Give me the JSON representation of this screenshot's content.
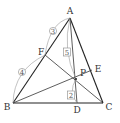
{
  "diagram": {
    "type": "triangle-cevians",
    "points": {
      "A": {
        "label": "A",
        "x": 70,
        "y": 18
      },
      "B": {
        "label": "B",
        "x": 13,
        "y": 103
      },
      "C": {
        "label": "C",
        "x": 103,
        "y": 103
      },
      "D": {
        "label": "D",
        "x": 77,
        "y": 103
      },
      "E": {
        "label": "E",
        "x": 92,
        "y": 70
      },
      "F": {
        "label": "F",
        "x": 45,
        "y": 55
      },
      "P": {
        "label": "P",
        "x": 76,
        "y": 79
      }
    },
    "segments": [
      "AB",
      "BC",
      "CA",
      "AD",
      "BE",
      "CF"
    ],
    "ratios": {
      "AF": {
        "value": "3",
        "style": "circled"
      },
      "FB": {
        "value": "4",
        "style": "circled"
      },
      "AP": {
        "value": "5",
        "style": "boxed"
      },
      "PD": {
        "value": "2",
        "style": "boxed"
      }
    }
  }
}
